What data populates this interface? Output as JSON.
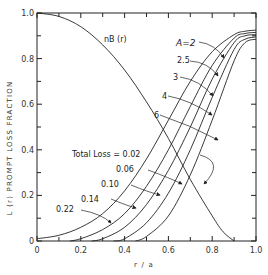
{
  "chart_data": {
    "type": "line",
    "title": "",
    "xlabel": "r / a",
    "ylabel": "L (r) PROMPT LOSS FRACTION",
    "xlim": [
      0,
      1.0
    ],
    "ylim": [
      0,
      1.0
    ],
    "grid": false,
    "x_ticks": [
      "0",
      "0.2",
      "0.4",
      "0.6",
      "0.8",
      "1.0"
    ],
    "y_ticks": [
      "0",
      "0.2",
      "0.4",
      "0.6",
      "0.8",
      "1.0"
    ],
    "series": [
      {
        "name": "n_B (r)",
        "label": "nB (r)",
        "x": [
          0,
          0.1,
          0.2,
          0.3,
          0.4,
          0.5,
          0.6,
          0.7,
          0.8,
          0.85,
          0.9
        ],
        "values": [
          1.0,
          0.985,
          0.94,
          0.86,
          0.75,
          0.61,
          0.45,
          0.27,
          0.11,
          0.04,
          0.0
        ]
      },
      {
        "name": "A=2, Total Loss = 0.22",
        "x": [
          0,
          0.1,
          0.2,
          0.3,
          0.4,
          0.5,
          0.6,
          0.7,
          0.8,
          0.9,
          0.95,
          1.0
        ],
        "values": [
          0.01,
          0.025,
          0.06,
          0.12,
          0.22,
          0.36,
          0.53,
          0.7,
          0.83,
          0.905,
          0.92,
          0.925
        ]
      },
      {
        "name": "A=2.5, Total Loss = 0.14",
        "x": [
          0.15,
          0.2,
          0.3,
          0.4,
          0.5,
          0.6,
          0.7,
          0.8,
          0.9,
          0.95,
          1.0
        ],
        "values": [
          0.0,
          0.01,
          0.05,
          0.12,
          0.24,
          0.4,
          0.59,
          0.77,
          0.89,
          0.91,
          0.915
        ]
      },
      {
        "name": "A=3, Total Loss = 0.10",
        "x": [
          0.25,
          0.3,
          0.4,
          0.5,
          0.6,
          0.7,
          0.8,
          0.9,
          0.95,
          1.0
        ],
        "values": [
          0.0,
          0.01,
          0.06,
          0.16,
          0.31,
          0.5,
          0.71,
          0.87,
          0.9,
          0.905
        ]
      },
      {
        "name": "A=4, Total Loss = 0.06",
        "x": [
          0.35,
          0.4,
          0.5,
          0.6,
          0.7,
          0.8,
          0.9,
          0.95,
          1.0
        ],
        "values": [
          0.0,
          0.01,
          0.08,
          0.21,
          0.4,
          0.63,
          0.84,
          0.885,
          0.895
        ]
      },
      {
        "name": "A=6, Total Loss = 0.02",
        "x": [
          0.45,
          0.5,
          0.6,
          0.7,
          0.8,
          0.9,
          0.95,
          1.0
        ],
        "values": [
          0.0,
          0.02,
          0.11,
          0.29,
          0.53,
          0.79,
          0.87,
          0.885
        ]
      }
    ],
    "annotations": {
      "A_labels": [
        "A=2",
        "2.5",
        "3",
        "4",
        "6"
      ],
      "loss_labels": [
        "Total Loss = 0.02",
        "0.06",
        "0.10",
        "0.14",
        "0.22"
      ],
      "nb_label": "nB (r)"
    }
  }
}
